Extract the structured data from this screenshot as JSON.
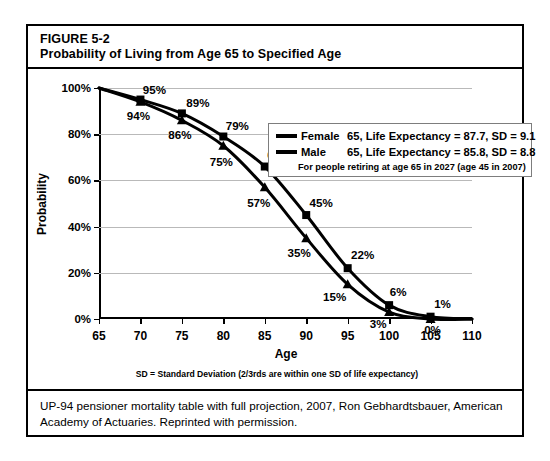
{
  "figure": {
    "number": "FIGURE 5-2",
    "title": "Probability of Living from Age 65 to Specified Age"
  },
  "source_note": "UP-94 pensioner mortality table with full projection, 2007, Ron Gebhardtsbauer, American Academy of Actuaries. Reprinted with permission.",
  "legend": {
    "female_name": "Female",
    "female_desc": "65, Life Expectancy = 87.7, SD = 9.1",
    "male_name": "Male",
    "male_desc": "65, Life Expectancy = 85.8, SD = 8.8",
    "note": "For people retiring at age 65 in 2027 (age 45 in 2007)"
  },
  "chart_data": {
    "type": "line",
    "title": "Probability of Living from Age 65 to Specified Age",
    "xlabel": "Age",
    "ylabel": "Probability",
    "xlim": [
      65,
      110
    ],
    "ylim": [
      0,
      100
    ],
    "xticks": [
      65,
      70,
      75,
      80,
      85,
      90,
      95,
      100,
      105,
      110
    ],
    "xticklabels": [
      "65",
      "70",
      "75",
      "80",
      "85",
      "90",
      "95",
      "100",
      "105",
      "110"
    ],
    "yticks": [
      0,
      20,
      40,
      60,
      80,
      100
    ],
    "yticklabels": [
      "0%",
      "20%",
      "40%",
      "60%",
      "80%",
      "100%"
    ],
    "grid": "horizontal",
    "legend_position": "upper right",
    "annotation": "SD = Standard Deviation (2/3rds are within one SD of life expectancy)",
    "x": [
      65,
      70,
      75,
      80,
      85,
      90,
      95,
      100,
      105,
      110
    ],
    "series": [
      {
        "name": "Female",
        "marker": "square",
        "values": [
          100,
          95,
          89,
          79,
          66,
          45,
          22,
          6,
          1,
          0
        ],
        "labels": [
          "",
          "95%",
          "89%",
          "79%",
          "66%",
          "45%",
          "22%",
          "6%",
          "1%",
          ""
        ]
      },
      {
        "name": "Male",
        "marker": "triangle",
        "values": [
          100,
          94,
          86,
          75,
          57,
          35,
          15,
          3,
          0,
          0
        ],
        "labels": [
          "",
          "94%",
          "86%",
          "75%",
          "57%",
          "35%",
          "15%",
          "3%",
          "0%",
          ""
        ]
      }
    ]
  }
}
